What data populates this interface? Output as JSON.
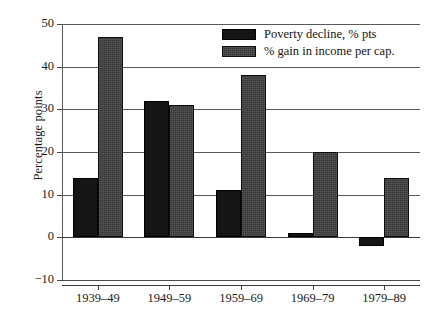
{
  "chart_data": {
    "type": "bar",
    "title": "",
    "xlabel": "",
    "ylabel": "Percentage points",
    "categories": [
      "1939–49",
      "1949–59",
      "1959–69",
      "1969–79",
      "1979–89"
    ],
    "series": [
      {
        "name": "Poverty decline, % pts",
        "color": "#151515",
        "values": [
          14,
          32,
          11,
          1,
          -2
        ]
      },
      {
        "name": "% gain in income per cap.",
        "color": "#383838",
        "values": [
          47,
          31,
          38,
          20,
          14
        ]
      }
    ],
    "ylim": [
      -10,
      50
    ],
    "yticks": [
      50,
      40,
      30,
      20,
      10,
      0,
      -10
    ],
    "ytick_labels": [
      "50",
      "40",
      "30",
      "20",
      "10",
      "0",
      "−10"
    ],
    "grid": true,
    "legend_position": "top-right"
  }
}
